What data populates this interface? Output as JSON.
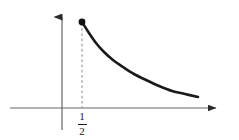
{
  "figure": {
    "background_color": "#ffffff",
    "width": 239,
    "height": 140,
    "stroke_color": "#1a1a1a",
    "axis_color": "#4d4d4d",
    "dash_color": "#7a7a7a"
  },
  "labels": {
    "x_tick_half_numerator": "1",
    "x_tick_half_denominator": "2"
  },
  "chart_data": {
    "type": "line",
    "title": "",
    "xlabel": "",
    "ylabel": "",
    "grid": false,
    "legend": false,
    "axes": {
      "x_axis": {
        "pixel_y": 108,
        "pixel_x_start": 10,
        "pixel_x_end": 223,
        "arrow": "right"
      },
      "y_axis": {
        "pixel_x": 62,
        "pixel_y_start": 10,
        "pixel_y_end": 130,
        "arrow": "up"
      },
      "origin_pixel": [
        62,
        108
      ]
    },
    "x_tick_labels": [
      "1/2"
    ],
    "x_tick_positions": [
      0.5
    ],
    "annotations": [
      {
        "kind": "filled-point",
        "x": 0.5,
        "pixel": [
          82,
          22
        ],
        "label": ""
      },
      {
        "kind": "dashed-vertical-line",
        "x": 0.5,
        "pixel_x": 82,
        "pixel_y_top": 22,
        "pixel_y_bottom": 108
      }
    ],
    "series": [
      {
        "name": "decay-curve",
        "description": "decreasing convex curve beginning at x = 1/2 with a filled endpoint and decaying toward the x-axis",
        "closed_endpoint": true,
        "x": [
          0.5,
          0.62,
          0.76,
          0.93,
          1.12,
          1.35,
          1.62,
          1.94,
          2.32,
          2.78,
          3.33,
          4.0
        ],
        "y": [
          1.0,
          0.806,
          0.658,
          0.538,
          0.446,
          0.37,
          0.309,
          0.258,
          0.216,
          0.18,
          0.15,
          0.125
        ],
        "pixel_points": [
          [
            82,
            22
          ],
          [
            89,
            33
          ],
          [
            96,
            43
          ],
          [
            104,
            52
          ],
          [
            113,
            60
          ],
          [
            123,
            67
          ],
          [
            134,
            74
          ],
          [
            146,
            80
          ],
          [
            159,
            86
          ],
          [
            172,
            91
          ],
          [
            185,
            94
          ],
          [
            198,
            97
          ]
        ]
      }
    ]
  }
}
